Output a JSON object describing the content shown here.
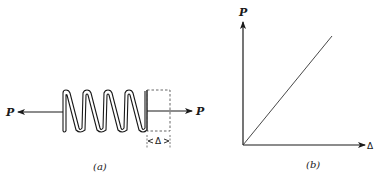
{
  "figure_a": {
    "caption": "(a)",
    "left_force_label": "P",
    "right_force_label": "P",
    "elongation_label": "Δ",
    "spring_coils": 5
  },
  "figure_b": {
    "caption": "(b)",
    "y_axis_label": "P",
    "x_axis_label": "Δ",
    "relation": "linear"
  },
  "colors": {
    "stroke": "#1a1a1a",
    "background": "#ffffff"
  }
}
